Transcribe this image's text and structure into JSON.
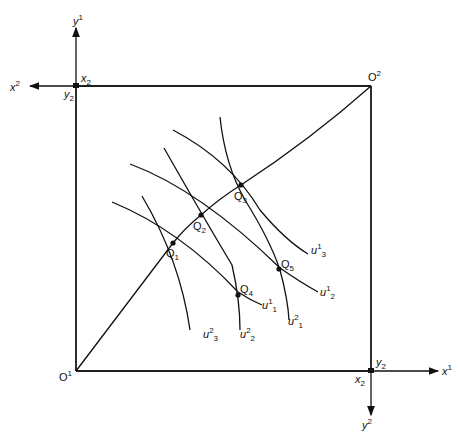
{
  "diagram": {
    "type": "edgeworth-box",
    "origins": {
      "consumer1": "O",
      "consumer1_sup": "1",
      "consumer2": "O",
      "consumer2_sup": "2"
    },
    "axes": {
      "y1": {
        "base": "y",
        "sup": "1"
      },
      "x2": {
        "base": "x",
        "sup": "2"
      },
      "x1": {
        "base": "x",
        "sup": "1"
      },
      "y2": {
        "base": "y",
        "sup": "2"
      }
    },
    "corner_labels": {
      "top_left_x": {
        "base": "x",
        "sub": "2"
      },
      "top_left_y": {
        "base": "y",
        "sub": "2"
      },
      "bottom_right_y": {
        "base": "y",
        "sub": "2"
      },
      "bottom_right_x": {
        "base": "x",
        "sub": "2"
      }
    },
    "points": [
      {
        "label": "Q",
        "sub": "1"
      },
      {
        "label": "Q",
        "sub": "2"
      },
      {
        "label": "Q",
        "sub": "3"
      },
      {
        "label": "Q",
        "sub": "4"
      },
      {
        "label": "Q",
        "sub": "5"
      }
    ],
    "indifference_curves": [
      {
        "base": "u",
        "sup": "1",
        "sub": "1"
      },
      {
        "base": "u",
        "sup": "1",
        "sub": "2"
      },
      {
        "base": "u",
        "sup": "1",
        "sub": "3"
      },
      {
        "base": "u",
        "sup": "2",
        "sub": "1"
      },
      {
        "base": "u",
        "sup": "2",
        "sub": "2"
      },
      {
        "base": "u",
        "sup": "2",
        "sub": "3"
      }
    ],
    "contract_curve": "O1 to O2 through Q1, Q2, Q3"
  }
}
